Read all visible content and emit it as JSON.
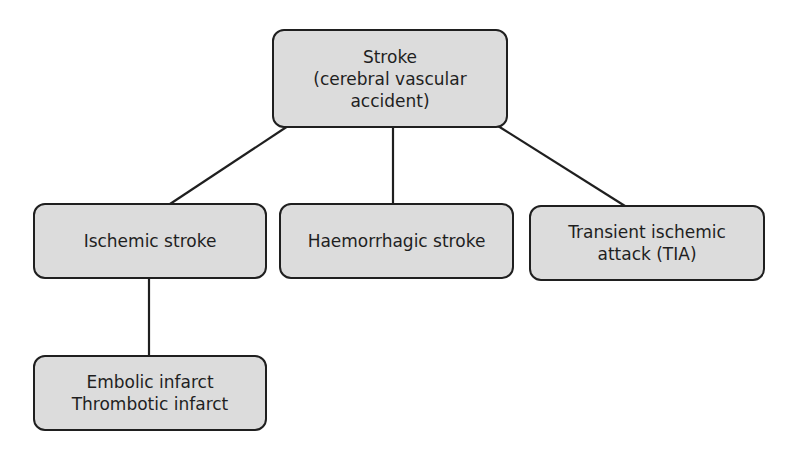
{
  "diagram": {
    "type": "hierarchy",
    "colors": {
      "node_fill": "#dcdcdc",
      "node_border": "#1f1f1f",
      "line": "#1f1f1f",
      "background": "#ffffff"
    },
    "nodes": {
      "root": {
        "lines": [
          "Stroke",
          "(cerebral vascular",
          "accident)"
        ]
      },
      "ischemic": {
        "lines": [
          "Ischemic stroke"
        ]
      },
      "haemorrhagic": {
        "lines": [
          "Haemorrhagic stroke"
        ]
      },
      "tia": {
        "lines": [
          "Transient ischemic",
          "attack (TIA)"
        ]
      },
      "infarct": {
        "lines": [
          "Embolic infarct",
          "Thrombotic infarct"
        ]
      }
    },
    "edges": [
      {
        "from": "root",
        "to": "ischemic"
      },
      {
        "from": "root",
        "to": "haemorrhagic"
      },
      {
        "from": "root",
        "to": "tia"
      },
      {
        "from": "ischemic",
        "to": "infarct"
      }
    ]
  }
}
